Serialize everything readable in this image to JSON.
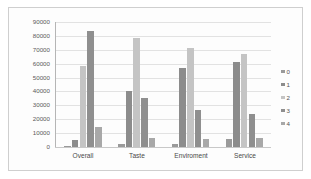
{
  "chart_data": {
    "type": "bar",
    "title": "",
    "xlabel": "",
    "ylabel": "",
    "categories": [
      "Overall",
      "Taste",
      "Enviroment",
      "Service"
    ],
    "ylim": [
      0,
      90000
    ],
    "yticks": [
      90000,
      80000,
      70000,
      60000,
      50000,
      40000,
      30000,
      20000,
      10000,
      0
    ],
    "ytick_labels": [
      "90000",
      "80000",
      "70000",
      "60000",
      "50000",
      "40000",
      "30000",
      "20000",
      "10000",
      "0"
    ],
    "grid": true,
    "legend_position": "right",
    "series": [
      {
        "name": "0",
        "color": "#9a9a9a",
        "values": [
          1000,
          2000,
          2000,
          5500
        ]
      },
      {
        "name": "1",
        "color": "#8c8c8c",
        "values": [
          5000,
          40500,
          57000,
          61500
        ]
      },
      {
        "name": "2",
        "color": "#c4c4c4",
        "values": [
          58000,
          78500,
          71000,
          67000
        ]
      },
      {
        "name": "3",
        "color": "#8f8f8f",
        "values": [
          83500,
          35500,
          26500,
          23500
        ]
      },
      {
        "name": "4",
        "color": "#a8a8a8",
        "values": [
          14500,
          6500,
          6000,
          6500
        ]
      }
    ]
  },
  "legend": {
    "items": [
      {
        "label": "0"
      },
      {
        "label": "1"
      },
      {
        "label": "2"
      },
      {
        "label": "3"
      },
      {
        "label": "4"
      }
    ]
  }
}
